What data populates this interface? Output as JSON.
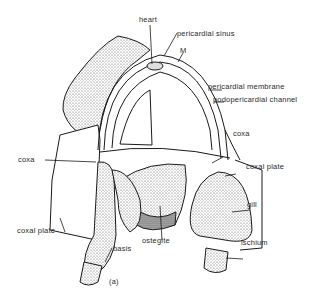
{
  "figure": {
    "caption": "(a)",
    "labels": {
      "heart": "heart",
      "pericardial_sinus": "pericardial sinus",
      "m": "M",
      "pericardial_membrane": "pericardial membrane",
      "podopericardial_channel": "podopericardial channel",
      "coxa_right": "coxa",
      "coxal_plate_right": "coxal plate",
      "coxa_left": "coxa",
      "gill": "gill",
      "coxal_plate_left": "coxal plate",
      "basis": "basis",
      "ostegite": "ostegite",
      "ischium": "ischium"
    }
  }
}
